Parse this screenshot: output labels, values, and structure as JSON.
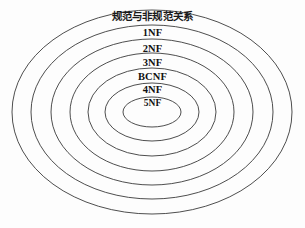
{
  "diagram": {
    "type": "concentric-ellipse-venn",
    "title": "规范与非规范关系",
    "background_color": "#ffffff",
    "stroke_color": "#3a3a3a",
    "text_color": "#111111",
    "center": {
      "x": 152,
      "y": 112
    },
    "rings": [
      {
        "id": "ring-outer",
        "label": "规范与非规范关系",
        "label_kind": "title",
        "level": 0,
        "rx": 140,
        "ry": 102,
        "label_y": 17
      },
      {
        "id": "ring-1nf",
        "label": "1NF",
        "label_kind": "normal-form",
        "level": 1,
        "rx": 121,
        "ry": 87,
        "label_y": 33
      },
      {
        "id": "ring-2nf",
        "label": "2NF",
        "label_kind": "normal-form",
        "level": 2,
        "rx": 101,
        "ry": 73,
        "label_y": 49
      },
      {
        "id": "ring-3nf",
        "label": "3NF",
        "label_kind": "normal-form",
        "level": 3,
        "rx": 82,
        "ry": 59,
        "label_y": 63
      },
      {
        "id": "ring-bcnf",
        "label": "BCNF",
        "label_kind": "normal-form",
        "level": 4,
        "rx": 64,
        "ry": 44,
        "label_y": 77
      },
      {
        "id": "ring-4nf",
        "label": "4NF",
        "label_kind": "normal-form",
        "level": 5,
        "rx": 47,
        "ry": 29,
        "label_y": 90
      },
      {
        "id": "ring-5nf",
        "label": "5NF",
        "label_kind": "normal-form",
        "level": 6,
        "rx": 29,
        "ry": 15,
        "label_y": 104
      }
    ]
  }
}
